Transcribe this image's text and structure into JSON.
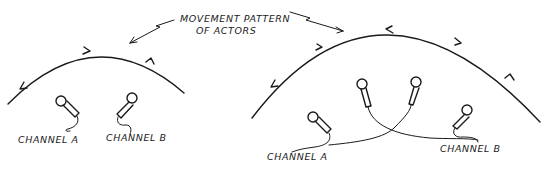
{
  "annotation": {
    "line1": "MOVEMENT PATTERN",
    "line2": "OF ACTORS"
  },
  "left_setup": {
    "channel_a_label": "CHANNEL A",
    "channel_b_label": "CHANNEL B",
    "microphones": 2
  },
  "right_setup": {
    "channel_a_label": "CHANNEL A",
    "channel_b_label": "CHANNEL B",
    "microphones": 4
  }
}
